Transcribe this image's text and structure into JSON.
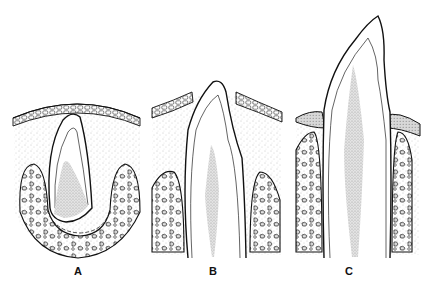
{
  "figure": {
    "panels": [
      {
        "id": "A",
        "label": "A",
        "stage": "unerupted tooth within crypt beneath oral epithelium",
        "label_x": 78
      },
      {
        "id": "B",
        "label": "B",
        "stage": "crown penetrating oral epithelium",
        "label_x": 213
      },
      {
        "id": "C",
        "label": "C",
        "stage": "tooth erupted into oral cavity with gingiva formed",
        "label_x": 349
      }
    ],
    "caption": "",
    "colors": {
      "line": "#111111",
      "stipple": "#9a9a9a",
      "pulp": "#c8c8c8",
      "background": "#ffffff"
    }
  }
}
